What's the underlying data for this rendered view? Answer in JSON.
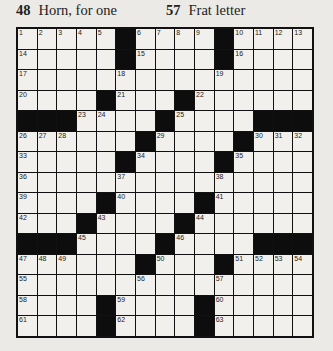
{
  "clues_visible": [
    {
      "number": "48",
      "text": "Horn, for one"
    },
    {
      "number": "57",
      "text": "Frat letter"
    }
  ],
  "grid": {
    "rows": 15,
    "cols": 15,
    "colors": {
      "black": "#0d0d0d",
      "white": "#f1f0ec",
      "background": "#ebeae6"
    },
    "layout": [
      ".....#....#....",
      ".....#....#....",
      "...............",
      "....#...#......",
      "###....#....###",
      "......#....#...",
      ".....#....#....",
      "...............",
      "....#....#.....",
      "...#....#......",
      "###....#....###",
      "......#...#....",
      "...............",
      "....#....#.....",
      "....#....#....."
    ],
    "numbers": [
      {
        "r": 0,
        "c": 0,
        "n": "1"
      },
      {
        "r": 0,
        "c": 1,
        "n": "2"
      },
      {
        "r": 0,
        "c": 2,
        "n": "3"
      },
      {
        "r": 0,
        "c": 3,
        "n": "4"
      },
      {
        "r": 0,
        "c": 4,
        "n": "5"
      },
      {
        "r": 0,
        "c": 6,
        "n": "6"
      },
      {
        "r": 0,
        "c": 7,
        "n": "7"
      },
      {
        "r": 0,
        "c": 8,
        "n": "8"
      },
      {
        "r": 0,
        "c": 9,
        "n": "9"
      },
      {
        "r": 0,
        "c": 11,
        "n": "10"
      },
      {
        "r": 0,
        "c": 12,
        "n": "11"
      },
      {
        "r": 0,
        "c": 13,
        "n": "12"
      },
      {
        "r": 0,
        "c": 14,
        "n": "13"
      },
      {
        "r": 1,
        "c": 0,
        "n": "14"
      },
      {
        "r": 1,
        "c": 6,
        "n": "15"
      },
      {
        "r": 1,
        "c": 11,
        "n": "16"
      },
      {
        "r": 2,
        "c": 0,
        "n": "17"
      },
      {
        "r": 2,
        "c": 5,
        "n": "18"
      },
      {
        "r": 2,
        "c": 10,
        "n": "19"
      },
      {
        "r": 3,
        "c": 0,
        "n": "20"
      },
      {
        "r": 3,
        "c": 5,
        "n": "21"
      },
      {
        "r": 3,
        "c": 9,
        "n": "22"
      },
      {
        "r": 4,
        "c": 3,
        "n": "23"
      },
      {
        "r": 4,
        "c": 4,
        "n": "24"
      },
      {
        "r": 4,
        "c": 8,
        "n": "25"
      },
      {
        "r": 5,
        "c": 0,
        "n": "26"
      },
      {
        "r": 5,
        "c": 1,
        "n": "27"
      },
      {
        "r": 5,
        "c": 2,
        "n": "28"
      },
      {
        "r": 5,
        "c": 7,
        "n": "29"
      },
      {
        "r": 5,
        "c": 12,
        "n": "30"
      },
      {
        "r": 5,
        "c": 13,
        "n": "31"
      },
      {
        "r": 5,
        "c": 14,
        "n": "32"
      },
      {
        "r": 6,
        "c": 0,
        "n": "33"
      },
      {
        "r": 6,
        "c": 6,
        "n": "34"
      },
      {
        "r": 6,
        "c": 11,
        "n": "35"
      },
      {
        "r": 7,
        "c": 0,
        "n": "36"
      },
      {
        "r": 7,
        "c": 5,
        "n": "37"
      },
      {
        "r": 7,
        "c": 10,
        "n": "38"
      },
      {
        "r": 8,
        "c": 0,
        "n": "39"
      },
      {
        "r": 8,
        "c": 5,
        "n": "40"
      },
      {
        "r": 8,
        "c": 10,
        "n": "41"
      },
      {
        "r": 9,
        "c": 0,
        "n": "42"
      },
      {
        "r": 9,
        "c": 4,
        "n": "43"
      },
      {
        "r": 9,
        "c": 9,
        "n": "44"
      },
      {
        "r": 10,
        "c": 3,
        "n": "45"
      },
      {
        "r": 10,
        "c": 8,
        "n": "46"
      },
      {
        "r": 11,
        "c": 0,
        "n": "47"
      },
      {
        "r": 11,
        "c": 1,
        "n": "48"
      },
      {
        "r": 11,
        "c": 2,
        "n": "49"
      },
      {
        "r": 11,
        "c": 7,
        "n": "50"
      },
      {
        "r": 11,
        "c": 11,
        "n": "51"
      },
      {
        "r": 11,
        "c": 12,
        "n": "52"
      },
      {
        "r": 11,
        "c": 13,
        "n": "53"
      },
      {
        "r": 11,
        "c": 14,
        "n": "54"
      },
      {
        "r": 12,
        "c": 0,
        "n": "55"
      },
      {
        "r": 12,
        "c": 6,
        "n": "56"
      },
      {
        "r": 12,
        "c": 10,
        "n": "57"
      },
      {
        "r": 13,
        "c": 0,
        "n": "58"
      },
      {
        "r": 13,
        "c": 5,
        "n": "59"
      },
      {
        "r": 13,
        "c": 10,
        "n": "60"
      },
      {
        "r": 14,
        "c": 0,
        "n": "61"
      },
      {
        "r": 14,
        "c": 5,
        "n": "62"
      },
      {
        "r": 14,
        "c": 10,
        "n": "63"
      }
    ]
  }
}
